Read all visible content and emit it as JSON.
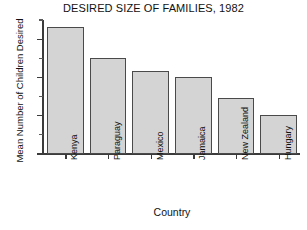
{
  "chart_data": {
    "type": "bar",
    "title": "DESIRED SIZE OF FAMILIES, 1982",
    "xlabel": "Country",
    "ylabel": "Mean Number of Children Desired",
    "categories": [
      "Kenya",
      "Paraguay",
      "Mexico",
      "Jamaica",
      "New Zealand",
      "Hungary"
    ],
    "values": [
      6.6,
      5.0,
      4.3,
      4.0,
      2.9,
      2.0
    ],
    "ylim": [
      0,
      7
    ],
    "ytick_labels": [
      "0",
      "2",
      "4",
      "6"
    ],
    "ytick_values": [
      0,
      2,
      4,
      6
    ],
    "yminor_ticks": [
      1,
      3,
      5,
      7
    ],
    "grid": false,
    "legend": false,
    "bar_fill": "#d4d4d4",
    "bar_edge": "#4a4a4a",
    "axis_color": "#3b3b3b"
  },
  "figure": {
    "background": "#ffffff"
  }
}
